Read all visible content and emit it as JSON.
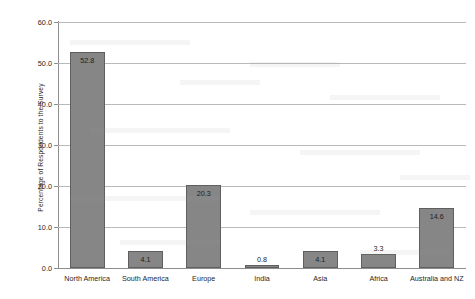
{
  "chart_data": {
    "type": "bar",
    "title": "",
    "xlabel": "",
    "ylabel": "Percentage of Respondents to the Survey",
    "categories": [
      "North America",
      "South America",
      "Europe",
      "India",
      "Asia",
      "Africa",
      "Australia and NZ"
    ],
    "values": [
      52.8,
      4.1,
      20.3,
      0.8,
      4.1,
      3.3,
      14.6
    ],
    "value_labels": [
      "52.8",
      "4.1",
      "20.3",
      "0.8",
      "4.1",
      "3.3",
      "14.6"
    ],
    "ylim": [
      0,
      60
    ],
    "ytick_labels": [
      "0.0",
      "10.0",
      "20.0",
      "30.0",
      "40.0",
      "50.0",
      "60.0"
    ],
    "ytick_values": [
      0,
      10,
      20,
      30,
      40,
      50,
      60
    ],
    "grid": "horizontal",
    "legend": "none",
    "bar_color": "#868686",
    "bar_border_color": "#5f5f5f",
    "gridline_color": "#b9b9b9",
    "axis_color": "#8d8d8d",
    "background_color": "#ffffff"
  }
}
